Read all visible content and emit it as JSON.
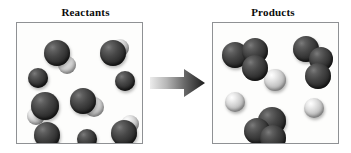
{
  "diagram": {
    "type": "chemical-reaction-space-filling-model",
    "panels": [
      {
        "id": "reactants",
        "title": "Reactants",
        "particle_count": 9,
        "description": "Nine separate particles: dark spheres alone and dark-light diatomic pairs"
      },
      {
        "id": "products",
        "title": "Products",
        "particle_count": 6,
        "description": "Three dark triatomic clusters and three free light spheres"
      }
    ],
    "arrow": {
      "name": "reaction-arrow",
      "direction": "right",
      "gradient_from": "#e8e8e8",
      "gradient_to": "#1c1c1c"
    },
    "colors": {
      "dark_atom": "#333333",
      "light_atom": "#dcdcdc",
      "box_border": "#8f9194",
      "box_fill": "#fdfdfc",
      "title_text": "#0a0a0a",
      "page_background": "#ffffff"
    }
  },
  "chart_data": {
    "type": "scatter",
    "xlabel": "",
    "ylabel": "",
    "grid": false,
    "legend": "none",
    "reactants": [
      {
        "name": "molecule-r1",
        "atoms": [
          {
            "element": "dark",
            "cx": 40,
            "cy": 30,
            "r": 13
          },
          {
            "element": "light",
            "cx": 50,
            "cy": 42,
            "r": 9
          }
        ]
      },
      {
        "name": "molecule-r2",
        "atoms": [
          {
            "element": "dark",
            "cx": 96,
            "cy": 30,
            "r": 13
          },
          {
            "element": "light",
            "cx": 103,
            "cy": 25,
            "r": 9
          }
        ]
      },
      {
        "name": "molecule-r3",
        "atoms": [
          {
            "element": "dark",
            "cx": 21,
            "cy": 55,
            "r": 10
          }
        ]
      },
      {
        "name": "molecule-r4",
        "atoms": [
          {
            "element": "dark",
            "cx": 108,
            "cy": 58,
            "r": 10
          }
        ]
      },
      {
        "name": "molecule-r5",
        "atoms": [
          {
            "element": "dark",
            "cx": 28,
            "cy": 83,
            "r": 14
          },
          {
            "element": "light",
            "cx": 19,
            "cy": 93,
            "r": 9
          }
        ]
      },
      {
        "name": "molecule-r6",
        "atoms": [
          {
            "element": "dark",
            "cx": 66,
            "cy": 78,
            "r": 13
          },
          {
            "element": "light",
            "cx": 77,
            "cy": 84,
            "r": 10
          }
        ]
      },
      {
        "name": "molecule-r7",
        "atoms": [
          {
            "element": "dark",
            "cx": 30,
            "cy": 112,
            "r": 13
          },
          {
            "element": "light",
            "cx": 34,
            "cy": 123,
            "r": 9
          }
        ]
      },
      {
        "name": "molecule-r8",
        "atoms": [
          {
            "element": "dark",
            "cx": 70,
            "cy": 116,
            "r": 10
          }
        ]
      },
      {
        "name": "molecule-r9",
        "atoms": [
          {
            "element": "dark",
            "cx": 107,
            "cy": 110,
            "r": 13
          },
          {
            "element": "light",
            "cx": 113,
            "cy": 101,
            "r": 9
          }
        ]
      }
    ],
    "products": [
      {
        "name": "molecule-p1",
        "atoms": [
          {
            "element": "dark",
            "cx": 22,
            "cy": 32,
            "r": 13
          },
          {
            "element": "dark",
            "cx": 42,
            "cy": 28,
            "r": 13
          },
          {
            "element": "dark",
            "cx": 42,
            "cy": 45,
            "r": 13
          }
        ]
      },
      {
        "name": "molecule-p2",
        "atoms": [
          {
            "element": "dark",
            "cx": 93,
            "cy": 26,
            "r": 13
          },
          {
            "element": "dark",
            "cx": 108,
            "cy": 36,
            "r": 12
          },
          {
            "element": "dark",
            "cx": 105,
            "cy": 53,
            "r": 13
          }
        ]
      },
      {
        "name": "molecule-p3",
        "atoms": [
          {
            "element": "dark",
            "cx": 59,
            "cy": 98,
            "r": 14
          },
          {
            "element": "dark",
            "cx": 44,
            "cy": 108,
            "r": 13
          },
          {
            "element": "dark",
            "cx": 60,
            "cy": 115,
            "r": 13
          }
        ]
      },
      {
        "name": "molecule-p4",
        "atoms": [
          {
            "element": "light",
            "cx": 62,
            "cy": 57,
            "r": 11
          }
        ]
      },
      {
        "name": "molecule-p5",
        "atoms": [
          {
            "element": "light",
            "cx": 22,
            "cy": 79,
            "r": 10
          }
        ]
      },
      {
        "name": "molecule-p6",
        "atoms": [
          {
            "element": "light",
            "cx": 101,
            "cy": 85,
            "r": 10
          }
        ]
      }
    ]
  }
}
